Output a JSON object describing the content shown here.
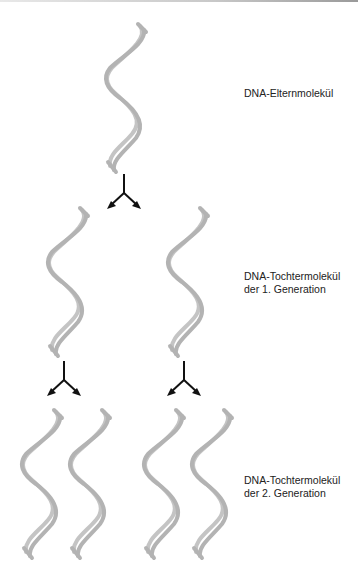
{
  "diagram": {
    "type": "dna-semiconservative-replication",
    "colors": {
      "helix_strand": "#b8b8b8",
      "arrow": "#111111",
      "text": "#222222"
    },
    "labels": {
      "parent": {
        "line1": "DNA-Elternmolekül"
      },
      "gen1": {
        "line1": "DNA-Tochtermolekül",
        "line2": "der 1. Generation"
      },
      "gen2": {
        "line1": "DNA-Tochtermolekül",
        "line2": "der 2. Generation"
      }
    },
    "nodes": [
      {
        "id": "parent-helix",
        "generation": 0,
        "count": 1
      },
      {
        "id": "gen1-helix",
        "generation": 1,
        "count": 2
      },
      {
        "id": "gen2-helix",
        "generation": 2,
        "count": 4
      }
    ],
    "edges": [
      {
        "from": "parent-helix",
        "to": "gen1-helix-left"
      },
      {
        "from": "parent-helix",
        "to": "gen1-helix-right"
      },
      {
        "from": "gen1-helix-left",
        "to": "gen2-helix-1"
      },
      {
        "from": "gen1-helix-left",
        "to": "gen2-helix-2"
      },
      {
        "from": "gen1-helix-right",
        "to": "gen2-helix-3"
      },
      {
        "from": "gen1-helix-right",
        "to": "gen2-helix-4"
      }
    ]
  }
}
